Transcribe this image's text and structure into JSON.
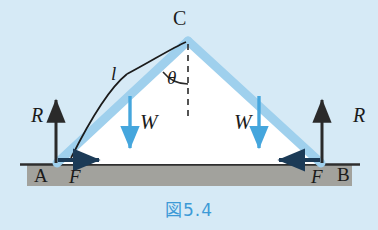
{
  "figure": {
    "caption": "図5.4",
    "caption_color": "#3d9ad6",
    "background_color": "#d6eaf6",
    "ground_color": "#a6a6a1",
    "ground_line_color": "#2e2e2e",
    "member_color": "#9fd0ed",
    "force_blue": "#45a6dd",
    "force_dark": "#1c3b57",
    "arrow_black": "#2a2a2a",
    "interior_color": "#ffffff",
    "dash_color": "#2a2a2a"
  },
  "labels": {
    "apex": "C",
    "base_left": "A",
    "base_right": "B",
    "reaction_left": "R",
    "reaction_right": "R",
    "friction_left": "F",
    "friction_right": "F",
    "weight_left": "W",
    "weight_right": "W",
    "angle": "θ",
    "length": "l"
  },
  "geometry": {
    "apex_x": 188,
    "apex_y": 40,
    "base_left_x": 56,
    "base_right_x": 322,
    "base_y": 164,
    "ground_top_y": 164,
    "ground_bottom_y": 186,
    "ground_left_x": 27,
    "ground_right_x": 352,
    "centerline_x": 188,
    "centerline_top_y": 44,
    "centerline_bottom_y": 118,
    "weight_left_x": 130,
    "weight_right_x": 259,
    "weight_top_y": 96,
    "weight_bottom_y": 150,
    "reaction_left_x": 56,
    "reaction_right_x": 322,
    "reaction_top_y": 98,
    "friction_left_from_x": 58,
    "friction_left_to_x": 100,
    "friction_right_from_x": 320,
    "friction_right_to_x": 278,
    "friction_y": 160
  }
}
